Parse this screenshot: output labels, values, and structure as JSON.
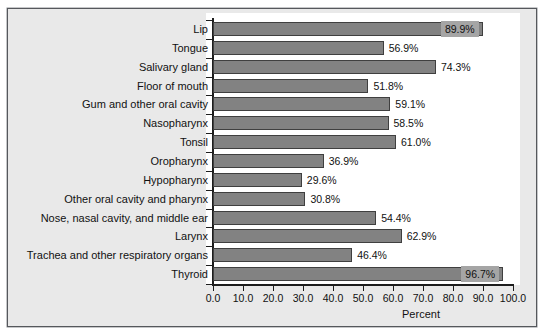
{
  "chart_data": {
    "type": "bar",
    "orientation": "horizontal",
    "title": "",
    "xlabel": "Percent",
    "ylabel": "",
    "xlim": [
      0.0,
      100.0
    ],
    "xticks": [
      "0.0",
      "10.0",
      "20.0",
      "30.0",
      "40.0",
      "50.0",
      "60.0",
      "70.0",
      "80.0",
      "90.0",
      "100.0"
    ],
    "xtick_values": [
      0,
      10,
      20,
      30,
      40,
      50,
      60,
      70,
      80,
      90,
      100
    ],
    "grid": false,
    "legend": null,
    "bar_color": "#828282",
    "bar_edge_color": "#3f3f3f",
    "panel_background": "#e9e9e9",
    "plot_background": "#ffffff",
    "categories": [
      "Lip",
      "Tongue",
      "Salivary gland",
      "Floor of mouth",
      "Gum and other oral cavity",
      "Nasopharynx",
      "Tonsil",
      "Oropharynx",
      "Hypopharynx",
      "Other oral cavity and pharynx",
      "Nose, nasal cavity, and middle ear",
      "Larynx",
      "Trachea and other respiratory organs",
      "Thyroid"
    ],
    "values": [
      89.9,
      56.9,
      74.3,
      51.8,
      59.1,
      58.5,
      61.0,
      36.9,
      29.6,
      30.8,
      54.4,
      62.9,
      46.4,
      96.7
    ],
    "value_labels": [
      "89.9%",
      "56.9%",
      "74.3%",
      "51.8%",
      "59.1%",
      "58.5%",
      "61.0%",
      "36.9%",
      "29.6%",
      "30.8%",
      "54.4%",
      "62.9%",
      "46.4%",
      "96.7%"
    ],
    "value_label_placement": [
      "inside",
      "outside",
      "outside",
      "outside",
      "outside",
      "outside",
      "outside",
      "outside",
      "outside",
      "outside",
      "outside",
      "outside",
      "outside",
      "inside"
    ]
  }
}
